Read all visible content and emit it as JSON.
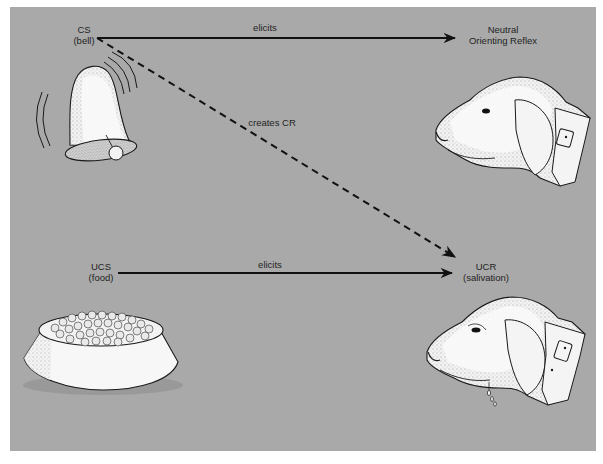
{
  "diagram": {
    "colors": {
      "panel": "#a9a9a9",
      "line": "#111111",
      "illustration_fill": "#f7f7f7",
      "illustration_stroke": "#1a1a1a"
    },
    "nodes": {
      "cs": {
        "line1": "CS",
        "line2": "(bell)"
      },
      "neutral": {
        "line1": "Neutral",
        "line2": "Orienting Reflex"
      },
      "ucs": {
        "line1": "UCS",
        "line2": "(food)"
      },
      "ucr": {
        "line1": "UCR",
        "line2": "(salivation)"
      }
    },
    "edges": {
      "cs_to_neutral": {
        "label": "elicits",
        "style": "solid"
      },
      "cs_to_ucr": {
        "label": "creates CR",
        "style": "dashed"
      },
      "ucs_to_ucr": {
        "label": "elicits",
        "style": "solid"
      }
    },
    "illustrations": {
      "bell": "ringing-bell",
      "bowl": "food-bowl",
      "dog_top": "dog-head-alert",
      "dog_bottom": "dog-head-salivating"
    }
  }
}
